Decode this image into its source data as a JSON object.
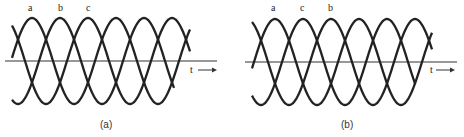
{
  "figure": {
    "panels": [
      {
        "id": "a",
        "caption": "(a)",
        "phase_labels": [
          "a",
          "b",
          "c"
        ],
        "axis_label": "t",
        "axis_arrow": "→"
      },
      {
        "id": "b",
        "caption": "(b)",
        "phase_labels": [
          "a",
          "c",
          "b"
        ],
        "axis_label": "t",
        "axis_arrow": "→"
      }
    ],
    "line_color": "#222222"
  }
}
